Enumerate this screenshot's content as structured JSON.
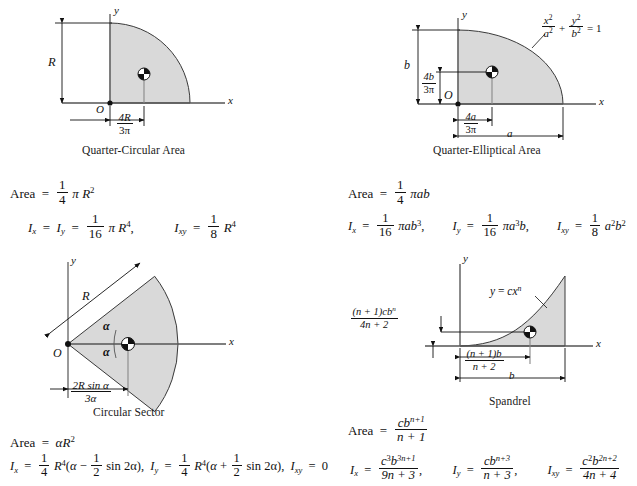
{
  "document": {
    "title": "Properties of Plane Areas",
    "shading_color": "#d9d9d9",
    "line_color": "#111111",
    "centroid_marker": "quartered-circle"
  },
  "sections": [
    {
      "id": "quarter-circular",
      "caption": "Quarter-Circular Area",
      "axes": {
        "x": "x",
        "y": "y",
        "origin": "O"
      },
      "dimensions": [
        {
          "name": "radius",
          "num": "R",
          "den": ""
        },
        {
          "name": "centroid-x",
          "num": "4R",
          "den": "3π"
        }
      ],
      "formulas": {
        "area_lhs": "Area",
        "area_eq": "=",
        "area_num": "1",
        "area_den": "4",
        "area_tail_pi": "π",
        "area_tail_var": "R",
        "area_tail_exp": "2",
        "ix_lhs": "I",
        "ix_sub": "x",
        "iy_lhs": "I",
        "iy_sub": "y",
        "i_num": "1",
        "i_den": "16",
        "i_pi": "π",
        "i_var": "R",
        "i_exp": "4",
        "ixy_lhs": "I",
        "ixy_sub": "xy",
        "ixy_num": "1",
        "ixy_den": "8",
        "ixy_var": "R",
        "ixy_exp": "4"
      }
    },
    {
      "id": "quarter-elliptical",
      "caption": "Quarter-Elliptical Area",
      "axes": {
        "x": "x",
        "y": "y",
        "origin": "O"
      },
      "curve_equation": {
        "x_var": "x",
        "x_exp": "2",
        "a_var": "a",
        "a_exp": "2",
        "plus": "+",
        "y_var": "y",
        "y_exp": "2",
        "b_var": "b",
        "b_exp": "2",
        "equals": "= 1"
      },
      "dimensions": [
        {
          "name": "semi-minor",
          "num": "b",
          "den": ""
        },
        {
          "name": "centroid-y",
          "num": "4b",
          "den": "3π"
        },
        {
          "name": "centroid-x",
          "num": "4a",
          "den": "3π"
        },
        {
          "name": "semi-major",
          "num": "a",
          "den": ""
        }
      ],
      "formulas": {
        "area_lhs": "Area",
        "area_num": "1",
        "area_den": "4",
        "area_tail": "πab",
        "ix_sub": "x",
        "ix_num": "1",
        "ix_den": "16",
        "ix_tail_pi": "π",
        "ix_tail_a": "ab",
        "ix_tail_exp": "3",
        "iy_sub": "y",
        "iy_num": "1",
        "iy_den": "16",
        "iy_tail_pi": "π",
        "iy_tail_a": "a",
        "iy_tail_exp": "3",
        "iy_tail_b": "b",
        "ixy_sub": "xy",
        "ixy_num": "1",
        "ixy_den": "8",
        "ixy_a": "a",
        "ixy_a_exp": "2",
        "ixy_b": "b",
        "ixy_b_exp": "2"
      }
    },
    {
      "id": "circular-sector",
      "caption": "Circular Sector",
      "axes": {
        "x": "x",
        "y": "y",
        "origin": "O"
      },
      "angle_label": "α",
      "radius_label": "R",
      "dimensions": [
        {
          "name": "centroid-x",
          "num": "2R sin α",
          "den": "3α"
        }
      ],
      "formulas": {
        "area_lhs": "Area",
        "area_rhs_alpha": "α",
        "area_rhs_var": "R",
        "area_rhs_exp": "2",
        "ix_sub": "x",
        "ix_num": "1",
        "ix_den": "4",
        "ix_var": "R",
        "ix_exp": "4",
        "ix_paren_open": "(",
        "ix_alpha": "α",
        "ix_op": "−",
        "ix_half_num": "1",
        "ix_half_den": "2",
        "ix_sin": "sin 2α",
        "ix_paren_close": ")",
        "iy_sub": "y",
        "iy_num": "1",
        "iy_den": "4",
        "iy_var": "R",
        "iy_exp": "4",
        "iy_alpha": "α",
        "iy_op": "+",
        "iy_half_num": "1",
        "iy_half_den": "2",
        "iy_sin": "sin 2α",
        "ixy_sub": "xy",
        "ixy_value": "0"
      }
    },
    {
      "id": "spandrel",
      "caption": "Spandrel",
      "axes": {
        "x": "x",
        "y": "y"
      },
      "curve_equation": {
        "lhs": "y",
        "eq": "=",
        "c": "cx",
        "exp": "n"
      },
      "dimensions": [
        {
          "name": "centroid-y",
          "num": "(n + 1)cb",
          "num_exp": "n",
          "den": "4n + 2"
        },
        {
          "name": "centroid-x",
          "num": "(n + 1)b",
          "den": "n + 2"
        },
        {
          "name": "base",
          "num": "b",
          "den": ""
        }
      ],
      "formulas": {
        "area_lhs": "Area",
        "area_num_c": "cb",
        "area_num_exp": "n+1",
        "area_den": "n + 1",
        "ix_sub": "x",
        "ix_num_c": "c",
        "ix_num_c_exp": "3",
        "ix_num_b": "b",
        "ix_num_b_exp": "3n+1",
        "ix_den": "9n + 3",
        "iy_sub": "y",
        "iy_num_c": "cb",
        "iy_num_exp": "n+3",
        "iy_den": "n + 3",
        "ixy_sub": "xy",
        "ixy_num_c": "c",
        "ixy_num_c_exp": "2",
        "ixy_num_b": "b",
        "ixy_num_b_exp": "2n+2",
        "ixy_den": "4n + 4"
      }
    }
  ]
}
